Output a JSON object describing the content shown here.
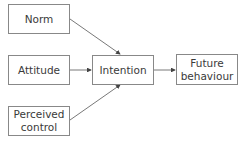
{
  "diagram": {
    "nodes": [
      {
        "id": "norm",
        "label": "Norm"
      },
      {
        "id": "attitude",
        "label": "Attitude"
      },
      {
        "id": "perceived",
        "label": "Perceived control"
      },
      {
        "id": "intention",
        "label": "Intention"
      },
      {
        "id": "future",
        "label": "Future behaviour"
      }
    ],
    "labels": {
      "norm": "Norm",
      "attitude": "Attitude",
      "perceived_l1": "Perceived",
      "perceived_l2": "control",
      "intention": "Intention",
      "future_l1": "Future",
      "future_l2": "behaviour"
    },
    "edges": [
      {
        "from": "norm",
        "to": "intention"
      },
      {
        "from": "attitude",
        "to": "intention"
      },
      {
        "from": "perceived",
        "to": "intention"
      },
      {
        "from": "intention",
        "to": "future"
      }
    ],
    "colors": {
      "line": "#555555",
      "border": "#888888",
      "text": "#3a3a3a"
    }
  }
}
